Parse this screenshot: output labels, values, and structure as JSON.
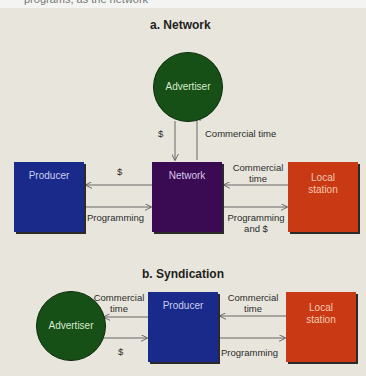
{
  "caption_fragment": "programs, as the network",
  "colors": {
    "background": "#e8e6dc",
    "producer": "#1a2a8a",
    "network": "#3a0a52",
    "local_station": "#c93a14",
    "advertiser": "#165016",
    "arrow": "#555555"
  },
  "network_diagram": {
    "title": "a.  Network",
    "nodes": {
      "advertiser": "Advertiser",
      "producer": "Producer",
      "network": "Network",
      "local_station_line1": "Local",
      "local_station_line2": "station"
    },
    "edges": {
      "advertiser_to_network": "$",
      "network_to_advertiser": "Commercial time",
      "network_to_producer": "$",
      "producer_to_network": "Programming",
      "local_to_network_line1": "Commercial",
      "local_to_network_line2": "time",
      "network_to_local_line1": "Programming",
      "network_to_local_line2": "and $"
    }
  },
  "syndication_diagram": {
    "title": "b.  Syndication",
    "nodes": {
      "advertiser": "Advertiser",
      "producer": "Producer",
      "local_station_line1": "Local",
      "local_station_line2": "station"
    },
    "edges": {
      "producer_to_advertiser_line1": "Commercial",
      "producer_to_advertiser_line2": "time",
      "advertiser_to_producer": "$",
      "local_to_producer_line1": "Commercial",
      "local_to_producer_line2": "time",
      "producer_to_local": "Programming"
    }
  }
}
